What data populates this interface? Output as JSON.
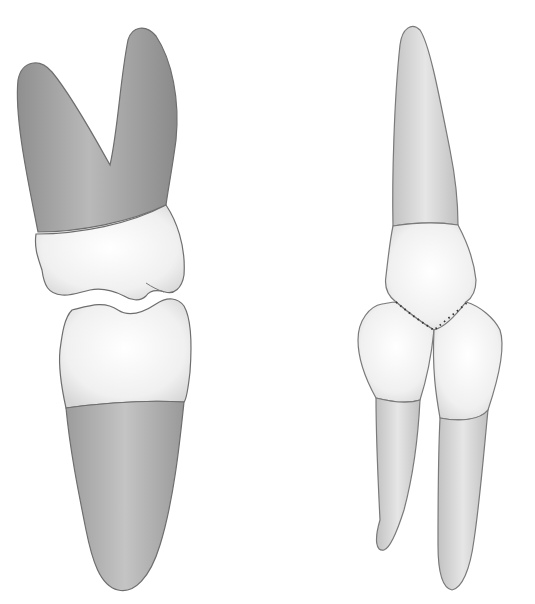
{
  "figure": {
    "background": "#ffffff",
    "left_group": {
      "label": "upper molar occluding with lower tooth (lateral view)",
      "root_color": "#a8a8a8",
      "crown_color": "#f2f2f2",
      "outline_color": "#6e6e6e"
    },
    "right_group": {
      "label": "upper incisor occluding between two lower incisors (labial view)",
      "root_color": "#d4d4d4",
      "crown_color": "#f4f4f4",
      "contact_marking": "dotted line",
      "outline_color": "#7a7a7a"
    }
  }
}
